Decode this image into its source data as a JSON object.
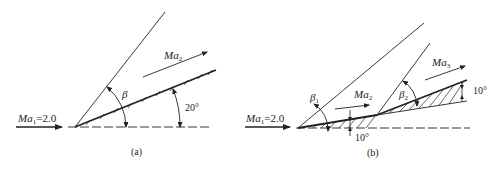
{
  "panels": [
    {
      "id": "a",
      "caption": "(a)",
      "incoming_flow": {
        "label_main": "Ma",
        "label_sub": "1",
        "label_value": "=2.0"
      },
      "downstream_flow": {
        "label_main": "Ma",
        "label_sub": "2"
      },
      "shock_angle": {
        "label": "β"
      },
      "wedge_angle": {
        "label": "20°"
      }
    },
    {
      "id": "b",
      "caption": "(b)",
      "incoming_flow": {
        "label_main": "Ma",
        "label_sub": "1",
        "label_value": "=2.0"
      },
      "middle_flow": {
        "label_main": "Ma",
        "label_sub": "2"
      },
      "downstream_flow": {
        "label_main": "Ma",
        "label_sub": "3"
      },
      "shock_angle_1": {
        "label_main": "β",
        "label_sub": "1"
      },
      "shock_angle_2": {
        "label_main": "β",
        "label_sub": "2"
      },
      "wedge_angle_1": {
        "label": "10°"
      },
      "wedge_angle_2": {
        "label": "10°"
      }
    }
  ]
}
